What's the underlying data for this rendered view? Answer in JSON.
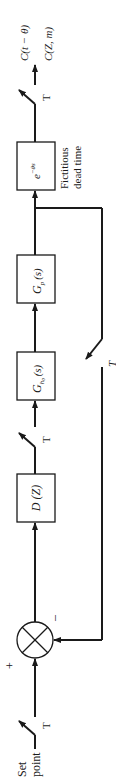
{
  "diagram": {
    "input_label_line1": "Set",
    "input_label_line2": "point",
    "sum_plus": "+",
    "sum_minus": "–",
    "sampler_label": "T",
    "controller": "D (Z)",
    "hold_main": "G",
    "hold_sub": "h",
    "hold_sub2": "0",
    "hold_arg": "(s)",
    "plant_main": "G",
    "plant_sub": "p",
    "plant_arg": "(s)",
    "deadtime_main": "e",
    "deadtime_exp": "−θs",
    "deadtime_label_line1": "Fictitious",
    "deadtime_label_line2": "dead time",
    "output_label_1": "C(t − θ)",
    "output_label_2": "C(Z, m)",
    "feedback_sampler_label": "T"
  }
}
